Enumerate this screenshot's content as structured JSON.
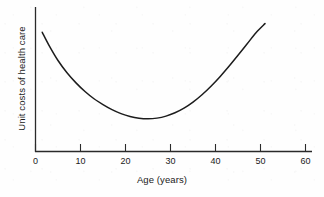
{
  "chart_data": {
    "type": "line",
    "title": "",
    "subtitle": "",
    "xlabel": "Age (years)",
    "ylabel": "Unit costs of health care",
    "xlim": [
      0,
      62
    ],
    "ylim": [
      0,
      1
    ],
    "grid": false,
    "legend": null,
    "xticks": [
      0,
      10,
      20,
      30,
      40,
      50,
      60
    ],
    "xtick_labels": [
      "0",
      "10",
      "20",
      "30",
      "40",
      "50",
      "60"
    ],
    "yticks": [],
    "ytick_labels": [],
    "annotations": [],
    "series": [
      {
        "name": "Unit costs of health care by age",
        "x": [
          1.5,
          3,
          5,
          7,
          9,
          11,
          13,
          15,
          17,
          19,
          21,
          23,
          25,
          27,
          29,
          31,
          33,
          35,
          37,
          39,
          41,
          43,
          45,
          47,
          49,
          51
        ],
        "y": [
          0.825,
          0.735,
          0.63,
          0.545,
          0.475,
          0.415,
          0.365,
          0.325,
          0.29,
          0.262,
          0.242,
          0.23,
          0.226,
          0.231,
          0.245,
          0.268,
          0.3,
          0.342,
          0.393,
          0.452,
          0.518,
          0.59,
          0.666,
          0.744,
          0.822,
          0.885
        ]
      }
    ]
  },
  "axes": {
    "x_axis_title": "Age (years)",
    "y_axis_title": "Unit costs of health care",
    "x_tick_values": [
      "0",
      "10",
      "20",
      "30",
      "40",
      "50",
      "60"
    ]
  },
  "style": {
    "curve_color": "#1c1c1c",
    "axis_color": "#2a2a2a",
    "text_color": "#1a1a1a",
    "background_color": "#fefefe"
  }
}
